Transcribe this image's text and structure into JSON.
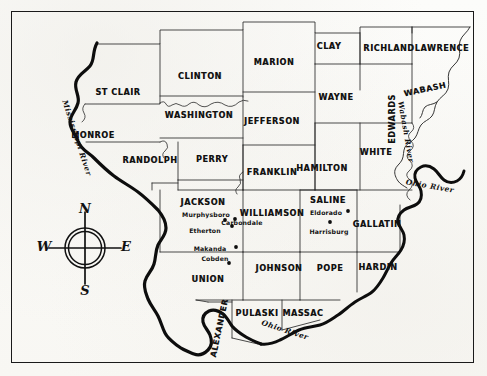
{
  "map": {
    "title": "Southern Illinois Counties Map",
    "background_color": "#fbfbf8",
    "ink_color": "#111111",
    "frame": {
      "color": "#1a1a1a"
    },
    "counties": [
      {
        "name": "ST CLAIR",
        "x": 118,
        "y": 92,
        "rotate": 0
      },
      {
        "name": "CLINTON",
        "x": 200,
        "y": 76,
        "rotate": 0
      },
      {
        "name": "MONROE",
        "x": 93,
        "y": 135,
        "rotate": 0
      },
      {
        "name": "WASHINGTON",
        "x": 199,
        "y": 115,
        "rotate": 0
      },
      {
        "name": "RANDOLPH",
        "x": 150,
        "y": 160,
        "rotate": 0
      },
      {
        "name": "PERRY",
        "x": 212,
        "y": 159,
        "rotate": 0
      },
      {
        "name": "MARION",
        "x": 274,
        "y": 62,
        "rotate": 0
      },
      {
        "name": "JEFFERSON",
        "x": 272,
        "y": 121,
        "rotate": 0
      },
      {
        "name": "FRANKLIN",
        "x": 272,
        "y": 172,
        "rotate": 0
      },
      {
        "name": "CLAY",
        "x": 329,
        "y": 46,
        "rotate": 0
      },
      {
        "name": "WAYNE",
        "x": 336,
        "y": 97,
        "rotate": 0
      },
      {
        "name": "HAMILTON",
        "x": 322,
        "y": 168,
        "rotate": 0
      },
      {
        "name": "RICHLAND",
        "x": 389,
        "y": 48,
        "rotate": 0
      },
      {
        "name": "LAWRENCE",
        "x": 442,
        "y": 48,
        "rotate": 0
      },
      {
        "name": "WABASH",
        "x": 425,
        "y": 89,
        "rotate": -12
      },
      {
        "name": "EDWARDS",
        "x": 392,
        "y": 119,
        "rotate": -90
      },
      {
        "name": "WHITE",
        "x": 376,
        "y": 152,
        "rotate": 0
      },
      {
        "name": "JACKSON",
        "x": 203,
        "y": 202,
        "rotate": 0
      },
      {
        "name": "WILLIAMSON",
        "x": 272,
        "y": 213,
        "rotate": 0
      },
      {
        "name": "SALINE",
        "x": 328,
        "y": 200,
        "rotate": 0
      },
      {
        "name": "GALLATIN",
        "x": 377,
        "y": 224,
        "rotate": 0
      },
      {
        "name": "UNION",
        "x": 208,
        "y": 279,
        "rotate": 0
      },
      {
        "name": "JOHNSON",
        "x": 279,
        "y": 268,
        "rotate": 0
      },
      {
        "name": "POPE",
        "x": 330,
        "y": 268,
        "rotate": 0
      },
      {
        "name": "HARDIN",
        "x": 378,
        "y": 267,
        "rotate": 0
      },
      {
        "name": "ALEXANDER",
        "x": 219,
        "y": 328,
        "rotate": -78
      },
      {
        "name": "PULASKI",
        "x": 257,
        "y": 313,
        "rotate": 0
      },
      {
        "name": "MASSAC",
        "x": 303,
        "y": 313,
        "rotate": 0
      }
    ],
    "cities": [
      {
        "name": "Murphysboro",
        "label_x": 206,
        "label_y": 214,
        "dot_x": 235,
        "dot_y": 219
      },
      {
        "name": "Carbondale",
        "label_x": 242,
        "label_y": 222,
        "dot_x": 225,
        "dot_y": 220
      },
      {
        "name": "Etherton",
        "label_x": 205,
        "label_y": 230,
        "dot_x": 232,
        "dot_y": 226
      },
      {
        "name": "Makanda",
        "label_x": 210,
        "label_y": 248,
        "dot_x": 236,
        "dot_y": 247
      },
      {
        "name": "Cobden",
        "label_x": 215,
        "label_y": 258,
        "dot_x": 229,
        "dot_y": 263
      },
      {
        "name": "Eldorado",
        "label_x": 326,
        "label_y": 212,
        "dot_x": 348,
        "dot_y": 211
      },
      {
        "name": "Harrisburg",
        "label_x": 329,
        "label_y": 231,
        "dot_x": 330,
        "dot_y": 222
      }
    ],
    "rivers": [
      {
        "name": "Mississippi River",
        "x": 77,
        "y": 138,
        "rotate": 72
      },
      {
        "name": "Wabash River",
        "x": 406,
        "y": 132,
        "rotate": 80
      },
      {
        "name": "Ohio River",
        "x": 430,
        "y": 186,
        "rotate": 10
      },
      {
        "name": "Ohio River",
        "x": 285,
        "y": 330,
        "rotate": 18
      }
    ],
    "compass": {
      "center_x": 85,
      "center_y": 248,
      "north": "N",
      "south": "S",
      "east": "E",
      "west": "W"
    }
  }
}
